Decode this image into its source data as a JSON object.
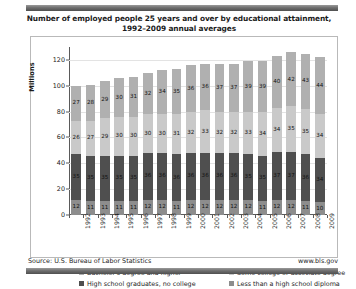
{
  "title": {
    "line1": "Number of employed people 25 years and over by educational attainment,",
    "line2": "1992–2009 annual averages"
  },
  "footer": {
    "source": "Source: U.S. Bureau of Labor Statistics",
    "website": "www.bls.gov"
  },
  "legend": {
    "items": [
      {
        "label": "Bachelor's degree and higher",
        "color": "#b0b0b0"
      },
      {
        "label": "Some college or associate degree",
        "color": "#c9c9c9"
      },
      {
        "label": "High school graduates, no college",
        "color": "#4f4f4f"
      },
      {
        "label": "Less than a high school diploma",
        "color": "#8d8d8d"
      }
    ]
  },
  "chart_data": {
    "type": "bar",
    "subtype": "stacked-column",
    "title": "Number of employed people 25 years and over by educational attainment, 1992–2009 annual averages",
    "xlabel": "",
    "ylabel": "Millions",
    "ylim": [
      0,
      130
    ],
    "yticks": [
      0,
      20,
      40,
      60,
      80,
      100,
      120
    ],
    "grid": true,
    "legend_position": "bottom",
    "categories": [
      "1992",
      "1993",
      "1994",
      "1995",
      "1996",
      "1997",
      "1998",
      "1999",
      "2000",
      "2001",
      "2002",
      "2003",
      "2004",
      "2005",
      "2006",
      "2007",
      "2008",
      "2009"
    ],
    "series": [
      {
        "name": "Less than a high school diploma",
        "color": "#8d8d8d",
        "stack_order": 0,
        "values": [
          12,
          11,
          11,
          11,
          11,
          12,
          12,
          11,
          12,
          12,
          12,
          12,
          12,
          11,
          12,
          12,
          11,
          10
        ]
      },
      {
        "name": "High school graduates, no college",
        "color": "#4f4f4f",
        "stack_order": 1,
        "values": [
          35,
          35,
          35,
          35,
          35,
          36,
          36,
          36,
          36,
          36,
          36,
          36,
          35,
          35,
          37,
          37,
          36,
          34
        ]
      },
      {
        "name": "Some college or associate degree",
        "color": "#c9c9c9",
        "stack_order": 2,
        "values": [
          26,
          27,
          29,
          30,
          30,
          30,
          30,
          31,
          32,
          33,
          32,
          32,
          33,
          34,
          34,
          35,
          35,
          34
        ]
      },
      {
        "name": "Bachelor's degree and higher",
        "color": "#b0b0b0",
        "stack_order": 3,
        "values": [
          27,
          28,
          29,
          30,
          31,
          32,
          34,
          35,
          36,
          36,
          37,
          37,
          39,
          39,
          40,
          42,
          43,
          44
        ]
      }
    ],
    "totals": [
      100,
      101,
      104,
      106,
      107,
      110,
      112,
      113,
      116,
      117,
      117,
      117,
      119,
      119,
      123,
      126,
      125,
      122
    ]
  }
}
